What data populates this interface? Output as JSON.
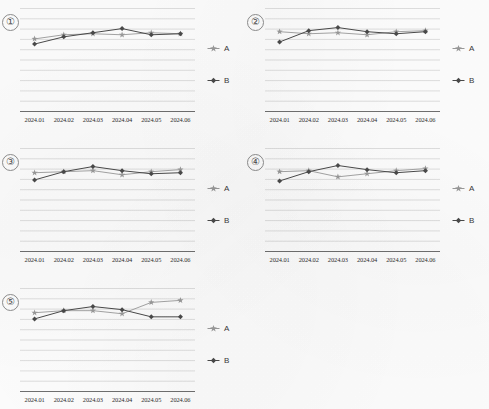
{
  "document": {
    "kind": "scanned-sheet-of-line-charts",
    "panel_count": 5
  },
  "legend": {
    "series_a_label": "A",
    "series_b_label": "B",
    "series_a_marker": "star-marker",
    "series_b_marker": "diamond-marker"
  },
  "colors": {
    "series_a": "#9a9a9a",
    "series_b": "#4a4a4a",
    "gridline": "#c9c9c9",
    "axis": "#6f6f6f",
    "text": "#2f2f2f"
  },
  "chart_data": [
    {
      "type": "line",
      "title": "①",
      "xlabel": "",
      "ylabel": "",
      "grid": true,
      "legend_position": "right",
      "categories": [
        "2024.01",
        "2024.02",
        "2024.03",
        "2024.04",
        "2024.05",
        "2024.06"
      ],
      "ylim": [
        0,
        10
      ],
      "series": [
        {
          "name": "A",
          "values": [
            7.0,
            7.4,
            7.5,
            7.4,
            7.6,
            7.5
          ]
        },
        {
          "name": "B",
          "values": [
            6.5,
            7.2,
            7.6,
            8.0,
            7.4,
            7.5
          ]
        }
      ]
    },
    {
      "type": "line",
      "title": "②",
      "xlabel": "",
      "ylabel": "",
      "grid": true,
      "legend_position": "right",
      "categories": [
        "2024.01",
        "2024.02",
        "2024.03",
        "2024.04",
        "2024.05",
        "2024.06"
      ],
      "ylim": [
        0,
        10
      ],
      "series": [
        {
          "name": "A",
          "values": [
            7.7,
            7.5,
            7.6,
            7.4,
            7.7,
            7.8
          ]
        },
        {
          "name": "B",
          "values": [
            6.7,
            7.8,
            8.1,
            7.7,
            7.5,
            7.7
          ]
        }
      ]
    },
    {
      "type": "line",
      "title": "③",
      "xlabel": "",
      "ylabel": "",
      "grid": true,
      "legend_position": "right",
      "categories": [
        "2024.01",
        "2024.02",
        "2024.03",
        "2024.04",
        "2024.05",
        "2024.06"
      ],
      "ylim": [
        0,
        10
      ],
      "series": [
        {
          "name": "A",
          "values": [
            7.6,
            7.7,
            7.8,
            7.4,
            7.7,
            7.9
          ]
        },
        {
          "name": "B",
          "values": [
            6.9,
            7.7,
            8.2,
            7.8,
            7.5,
            7.6
          ]
        }
      ]
    },
    {
      "type": "line",
      "title": "④",
      "xlabel": "",
      "ylabel": "",
      "grid": true,
      "legend_position": "right",
      "categories": [
        "2024.01",
        "2024.02",
        "2024.03",
        "2024.04",
        "2024.05",
        "2024.06"
      ],
      "ylim": [
        0,
        10
      ],
      "series": [
        {
          "name": "A",
          "values": [
            7.7,
            7.8,
            7.2,
            7.5,
            7.8,
            8.0
          ]
        },
        {
          "name": "B",
          "values": [
            6.8,
            7.7,
            8.3,
            7.9,
            7.6,
            7.8
          ]
        }
      ]
    },
    {
      "type": "line",
      "title": "⑤",
      "xlabel": "",
      "ylabel": "",
      "grid": true,
      "legend_position": "right",
      "categories": [
        "2024.01",
        "2024.02",
        "2024.03",
        "2024.04",
        "2024.05",
        "2024.06"
      ],
      "ylim": [
        0,
        10
      ],
      "series": [
        {
          "name": "A",
          "values": [
            7.6,
            7.8,
            7.8,
            7.5,
            8.6,
            8.8
          ]
        },
        {
          "name": "B",
          "values": [
            7.0,
            7.8,
            8.2,
            7.9,
            7.2,
            7.2
          ]
        }
      ]
    }
  ]
}
